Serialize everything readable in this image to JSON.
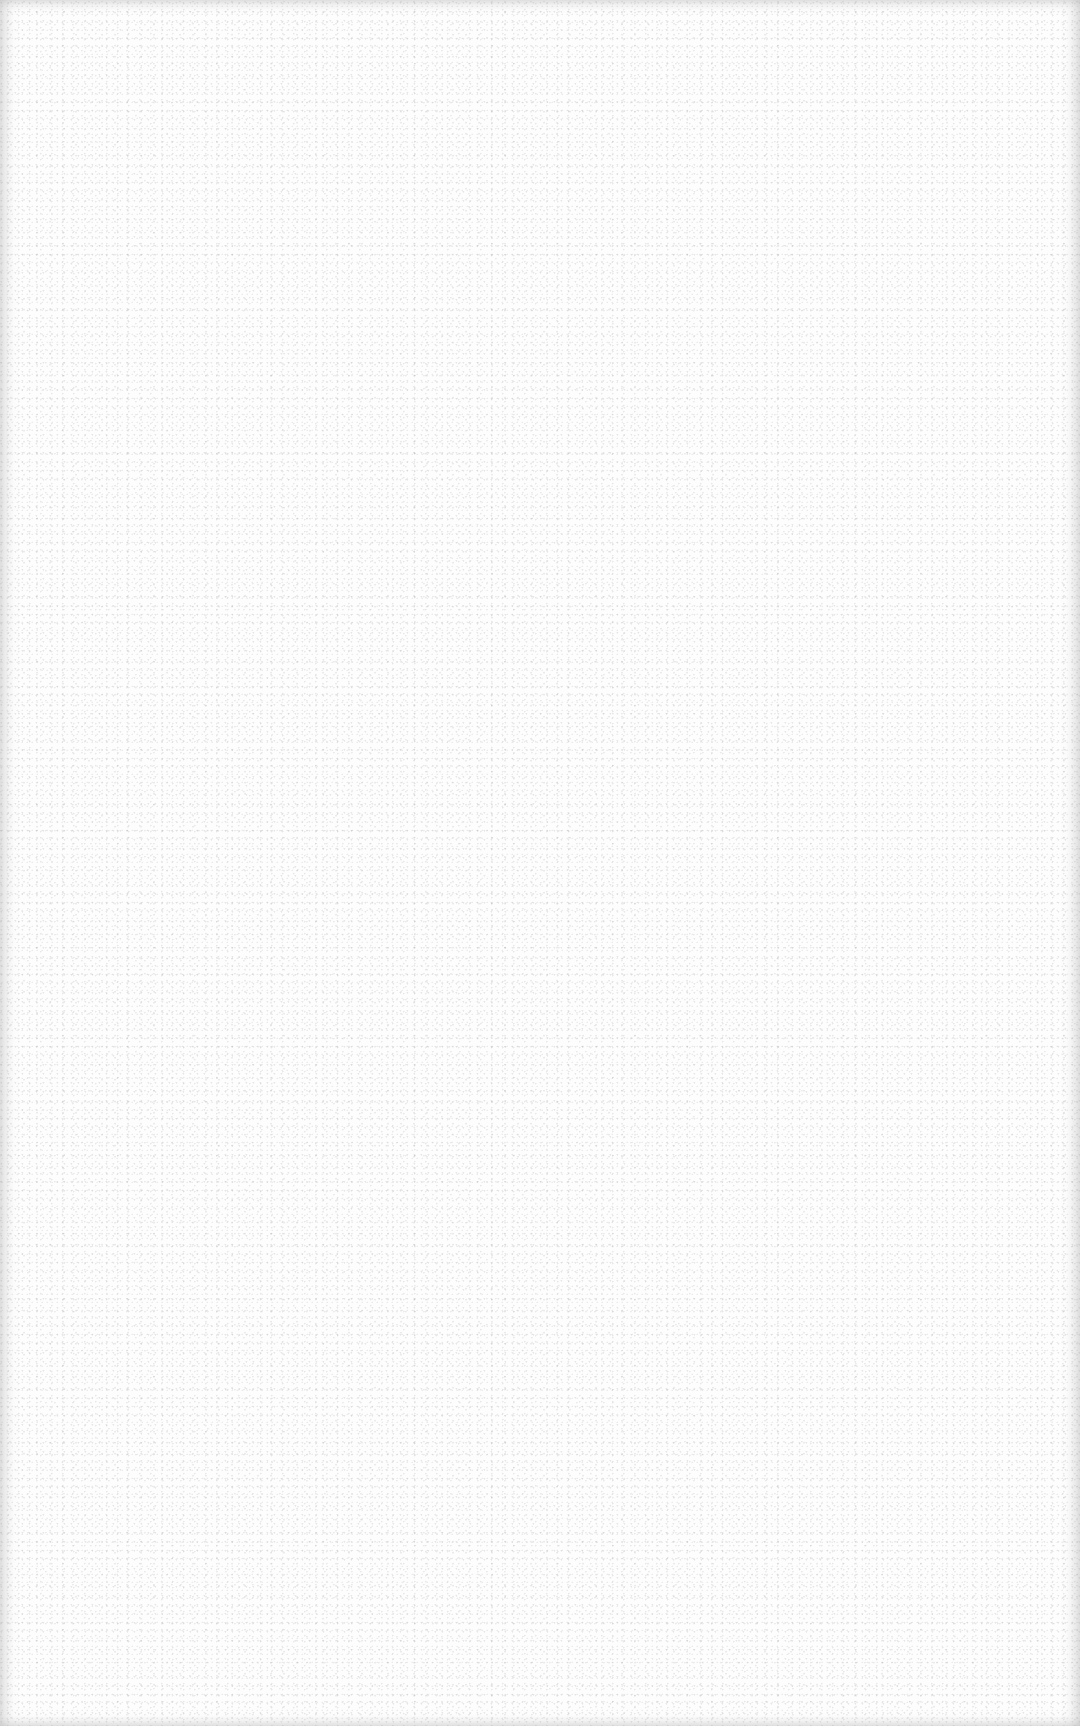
{
  "page": {
    "type": "blank-scanned-sheet",
    "background_color": "#fdfdfd",
    "speckle_color": "#969696",
    "edge_shadow_color": "#aaaaaa"
  }
}
